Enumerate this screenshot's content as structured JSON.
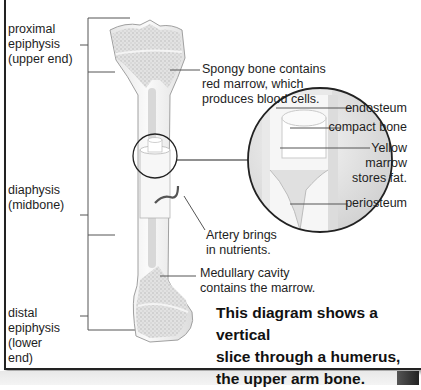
{
  "diagram": {
    "labels": {
      "proximal_epiphysis": "proximal\nepiphysis\n(upper end)",
      "diaphysis": "diaphysis\n(midbone)",
      "distal_epiphysis": "distal\nepiphysis\n(lower\nend)",
      "spongy_bone": "Spongy bone contains\nred marrow, which\nproduces blood cells.",
      "endosteum": "endosteum",
      "compact_bone": "compact bone",
      "yellow_marrow": "Yellow\nmarrow\nstores fat.",
      "periosteum": "periosteum",
      "artery": "Artery brings\nin nutrients.",
      "medullary_cavity": "Medullary cavity\ncontains the marrow."
    },
    "caption": "This diagram shows a vertical\nslice through a humerus,\nthe upper arm bone.",
    "colors": {
      "bone_fill": "#f1f1f1",
      "spongy_fill": "#d9d9d9",
      "outline": "#9a9a9a",
      "leader_line": "#555555",
      "artery": "#555555",
      "frame": "#222222"
    }
  }
}
